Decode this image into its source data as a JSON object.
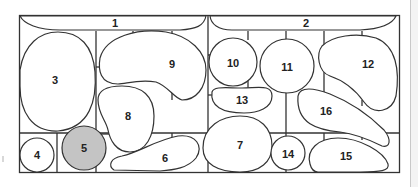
{
  "diagram": {
    "type": "numbered region plan",
    "highlight_color": "#c4c4c4",
    "line_color": "#333333",
    "background": "#ffffff",
    "highlighted_region": "5",
    "regions": [
      {
        "id": "1",
        "label": "1"
      },
      {
        "id": "2",
        "label": "2"
      },
      {
        "id": "3",
        "label": "3"
      },
      {
        "id": "4",
        "label": "4"
      },
      {
        "id": "5",
        "label": "5"
      },
      {
        "id": "6",
        "label": "6"
      },
      {
        "id": "7",
        "label": "7"
      },
      {
        "id": "8",
        "label": "8"
      },
      {
        "id": "9",
        "label": "9"
      },
      {
        "id": "10",
        "label": "10"
      },
      {
        "id": "11",
        "label": "11"
      },
      {
        "id": "12",
        "label": "12"
      },
      {
        "id": "13",
        "label": "13"
      },
      {
        "id": "14",
        "label": "14"
      },
      {
        "id": "15",
        "label": "15"
      },
      {
        "id": "16",
        "label": "16"
      }
    ]
  }
}
